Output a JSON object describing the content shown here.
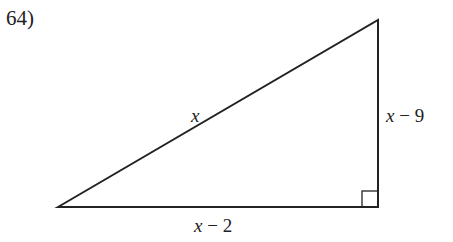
{
  "problem_number": "64)",
  "triangle": {
    "hypotenuse_label_var": "x",
    "vertical_leg": {
      "var": "x",
      "op": " − ",
      "const": "9"
    },
    "horizontal_leg": {
      "var": "x",
      "op": " − ",
      "const": "2"
    },
    "right_angle_marker": true
  },
  "colors": {
    "stroke": "#222222",
    "background": "#ffffff"
  }
}
